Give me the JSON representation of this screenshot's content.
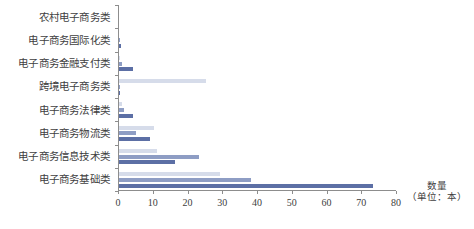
{
  "chart_data": {
    "type": "bar",
    "orientation": "horizontal",
    "title": "",
    "xlabel": "数量（单位：本）",
    "ylabel": "",
    "xlim": [
      0,
      80
    ],
    "xticks": [
      0,
      10,
      20,
      30,
      40,
      50,
      60,
      70,
      80
    ],
    "xtick_labels": [
      "0",
      "10",
      "20",
      "30",
      "40",
      "50",
      "60",
      "70",
      "80"
    ],
    "grid": false,
    "legend": "none",
    "categories": [
      "农村电子商务类",
      "电子商务国际化类",
      "电子商务金融支付类",
      "跨境电子商务类",
      "电子商务法律类",
      "电子商务物流类",
      "电子商务信息技术类",
      "电子商务基础类"
    ],
    "series": [
      {
        "name": "系列1",
        "color": "#d6dcea",
        "values": [
          0,
          0,
          0.3,
          25,
          1,
          10,
          11,
          29
        ]
      },
      {
        "name": "系列2",
        "color": "#8e9dc4",
        "values": [
          0,
          0.4,
          1,
          0.4,
          1.5,
          5,
          23,
          38
        ]
      },
      {
        "name": "系列3",
        "color": "#5c6fa5",
        "values": [
          0,
          0.6,
          4,
          0.3,
          4,
          9,
          16,
          73
        ]
      }
    ]
  },
  "axis_title": {
    "line1": "数量",
    "line2": "（单位：本）"
  },
  "colors": {
    "series1": "#d6dcea",
    "series2": "#8e9dc4",
    "series3": "#5c6fa5",
    "axis": "#8d8d8d",
    "text": "#404040",
    "background": "#ffffff"
  }
}
